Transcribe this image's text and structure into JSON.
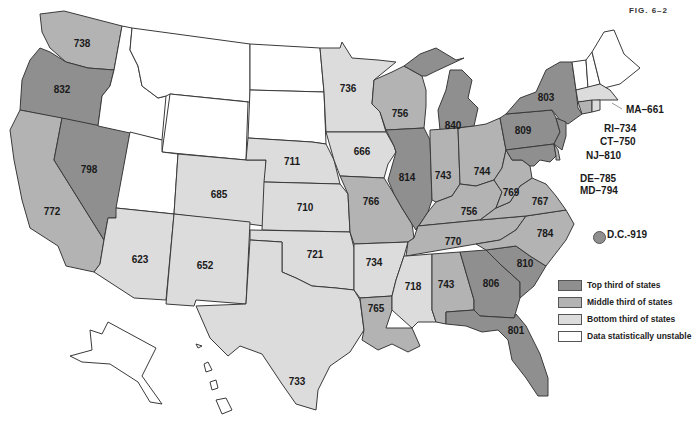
{
  "figure": {
    "label": "FIG. 6–2"
  },
  "colors": {
    "top": "#8f8f8f",
    "middle": "#b3b3b3",
    "bottom": "#dcdcdc",
    "unstable": "#ffffff",
    "border": "#3a3a3a"
  },
  "legend": {
    "items": [
      {
        "key": "top",
        "label": "Top third of states"
      },
      {
        "key": "middle",
        "label": "Middle third of states"
      },
      {
        "key": "bottom",
        "label": "Bottom third of states"
      },
      {
        "key": "unstable",
        "label": "Data statistically unstable"
      }
    ]
  },
  "states": [
    {
      "abbr": "WA",
      "value": "738",
      "tier": "middle"
    },
    {
      "abbr": "OR",
      "value": "832",
      "tier": "top"
    },
    {
      "abbr": "CA",
      "value": "772",
      "tier": "middle"
    },
    {
      "abbr": "NV",
      "value": "798",
      "tier": "top"
    },
    {
      "abbr": "ID",
      "value": "",
      "tier": "unstable"
    },
    {
      "abbr": "MT",
      "value": "",
      "tier": "unstable"
    },
    {
      "abbr": "WY",
      "value": "",
      "tier": "unstable"
    },
    {
      "abbr": "UT",
      "value": "",
      "tier": "unstable"
    },
    {
      "abbr": "AZ",
      "value": "623",
      "tier": "bottom"
    },
    {
      "abbr": "CO",
      "value": "685",
      "tier": "bottom"
    },
    {
      "abbr": "NM",
      "value": "652",
      "tier": "bottom"
    },
    {
      "abbr": "ND",
      "value": "",
      "tier": "unstable"
    },
    {
      "abbr": "SD",
      "value": "",
      "tier": "unstable"
    },
    {
      "abbr": "NE",
      "value": "711",
      "tier": "bottom"
    },
    {
      "abbr": "KS",
      "value": "710",
      "tier": "bottom"
    },
    {
      "abbr": "OK",
      "value": "721",
      "tier": "bottom"
    },
    {
      "abbr": "TX",
      "value": "733",
      "tier": "bottom"
    },
    {
      "abbr": "MN",
      "value": "736",
      "tier": "bottom"
    },
    {
      "abbr": "IA",
      "value": "666",
      "tier": "bottom"
    },
    {
      "abbr": "MO",
      "value": "766",
      "tier": "middle"
    },
    {
      "abbr": "AR",
      "value": "734",
      "tier": "bottom"
    },
    {
      "abbr": "LA",
      "value": "765",
      "tier": "middle"
    },
    {
      "abbr": "WI",
      "value": "756",
      "tier": "middle"
    },
    {
      "abbr": "IL",
      "value": "814",
      "tier": "top"
    },
    {
      "abbr": "MI",
      "value": "840",
      "tier": "top"
    },
    {
      "abbr": "IN",
      "value": "743",
      "tier": "middle"
    },
    {
      "abbr": "OH",
      "value": "744",
      "tier": "middle"
    },
    {
      "abbr": "KY",
      "value": "756",
      "tier": "middle"
    },
    {
      "abbr": "TN",
      "value": "770",
      "tier": "middle"
    },
    {
      "abbr": "MS",
      "value": "718",
      "tier": "bottom"
    },
    {
      "abbr": "AL",
      "value": "743",
      "tier": "middle"
    },
    {
      "abbr": "GA",
      "value": "806",
      "tier": "top"
    },
    {
      "abbr": "FL",
      "value": "801",
      "tier": "top"
    },
    {
      "abbr": "SC",
      "value": "810",
      "tier": "top"
    },
    {
      "abbr": "NC",
      "value": "784",
      "tier": "middle"
    },
    {
      "abbr": "VA",
      "value": "767",
      "tier": "middle"
    },
    {
      "abbr": "WV",
      "value": "769",
      "tier": "middle"
    },
    {
      "abbr": "PA",
      "value": "809",
      "tier": "top"
    },
    {
      "abbr": "NY",
      "value": "803",
      "tier": "top"
    },
    {
      "abbr": "NJ",
      "value": "810",
      "tier": "top"
    },
    {
      "abbr": "DE",
      "value": "785",
      "tier": "middle"
    },
    {
      "abbr": "MD",
      "value": "794",
      "tier": "top"
    },
    {
      "abbr": "CT",
      "value": "750",
      "tier": "middle"
    },
    {
      "abbr": "RI",
      "value": "734",
      "tier": "bottom"
    },
    {
      "abbr": "MA",
      "value": "661",
      "tier": "bottom"
    },
    {
      "abbr": "VT",
      "value": "",
      "tier": "unstable"
    },
    {
      "abbr": "NH",
      "value": "",
      "tier": "unstable"
    },
    {
      "abbr": "ME",
      "value": "",
      "tier": "unstable"
    },
    {
      "abbr": "AK",
      "value": "",
      "tier": "unstable"
    },
    {
      "abbr": "HI",
      "value": "",
      "tier": "unstable"
    },
    {
      "abbr": "DC",
      "value": "919",
      "tier": "top"
    }
  ],
  "callouts": {
    "MA": "MA–661",
    "RI": "RI–734",
    "CT": "CT–750",
    "NJ": "NJ–810",
    "DE": "DE–785",
    "MD": "MD–794",
    "DC": "D.C.-919"
  }
}
